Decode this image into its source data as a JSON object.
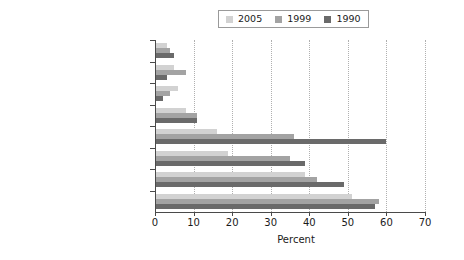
{
  "chart_data": {
    "type": "bar",
    "orientation": "horizontal",
    "title": "",
    "xlabel": "Percent",
    "ylabel": "",
    "xlim": [
      0,
      70
    ],
    "xticks": [
      0,
      10,
      20,
      30,
      40,
      50,
      60,
      70
    ],
    "grid": "vertical-dotted",
    "legend_position": "top-center",
    "categories": [
      "Northern Africa",
      "Former Soviet Union",
      "Western Asia",
      "Latin America & the Caribbean",
      "Eastern Asia",
      "South-Eastern Asia",
      "Southern Asia",
      "Sub-Saharan Africa"
    ],
    "series": [
      {
        "name": "2005",
        "color": "#d2d2d2",
        "values": [
          3,
          5,
          6,
          8,
          16,
          19,
          39,
          51
        ]
      },
      {
        "name": "1999",
        "color": "#a3a3a3",
        "values": [
          4,
          8,
          4,
          11,
          36,
          35,
          42,
          58
        ]
      },
      {
        "name": "1990",
        "color": "#6a6a6a",
        "values": [
          5,
          3,
          2,
          11,
          60,
          39,
          49,
          57
        ]
      }
    ]
  },
  "axis": {
    "tick_labels": [
      "0",
      "10",
      "20",
      "30",
      "40",
      "50",
      "60",
      "70"
    ],
    "x_title": "Percent"
  },
  "legend": {
    "items": [
      {
        "label": "2005",
        "color": "#d2d2d2"
      },
      {
        "label": "1999",
        "color": "#a3a3a3"
      },
      {
        "label": "1990",
        "color": "#6a6a6a"
      }
    ]
  }
}
